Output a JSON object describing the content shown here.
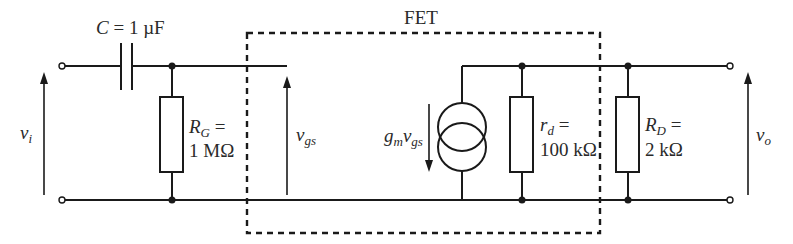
{
  "diagram": {
    "fet_box_label": "FET",
    "capacitor": {
      "symbol": "C",
      "equals": " = 1 µF"
    },
    "rg": {
      "symbol": "R",
      "sub": "G",
      "equals": " =",
      "value": "1 MΩ"
    },
    "rd_small": {
      "symbol": "r",
      "sub": "d",
      "equals": " =",
      "value": "100 kΩ"
    },
    "rd_load": {
      "symbol": "R",
      "sub": "D",
      "equals": " =",
      "value": "2 kΩ"
    },
    "current_source": {
      "g": "g",
      "g_sub": "m",
      "v": "v",
      "v_sub": "gs"
    },
    "input_voltage": {
      "symbol": "v",
      "sub": "i"
    },
    "gate_source_voltage": {
      "symbol": "v",
      "sub": "gs"
    },
    "output_voltage": {
      "symbol": "v",
      "sub": "o"
    },
    "colors": {
      "ink": "#1a1a1a",
      "text": "#2a2a2a",
      "background": "#ffffff"
    }
  }
}
